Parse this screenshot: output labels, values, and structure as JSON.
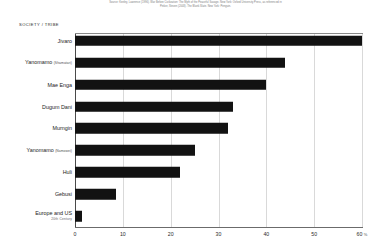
{
  "source_note": {
    "line1": "Source: Keeley, Lawrence (1996). War Before Civilization: The Myth of the Peaceful Savage. New York: Oxford University Press, as referenced in",
    "line2": "Pinker, Steven (2003). The Blank Slate. New York: Penguin."
  },
  "axis_title": "SOCIETY / TRIBE",
  "chart_data": {
    "type": "bar",
    "orientation": "horizontal",
    "title": "",
    "xlabel": "%",
    "ylabel": "SOCIETY / TRIBE",
    "xlim": [
      0,
      60
    ],
    "grid": true,
    "legend": "none",
    "xticks": [
      {
        "value": 0,
        "label": "0"
      },
      {
        "value": 10,
        "label": "10"
      },
      {
        "value": 20,
        "label": "20"
      },
      {
        "value": 30,
        "label": "30"
      },
      {
        "value": 40,
        "label": "40"
      },
      {
        "value": 50,
        "label": "50"
      },
      {
        "value": 60,
        "label": "60"
      }
    ],
    "x_unit": "%",
    "bar_color": "#121212",
    "categories": [
      "Jivaro",
      "Yanomamo (Shamatari)",
      "Mae Enga",
      "Dugum Dani",
      "Murngin",
      "Yanomamo (Namowei)",
      "Huli",
      "Gebusi",
      "Europe and US 20th Century"
    ],
    "values": [
      60,
      44,
      40,
      33,
      32,
      25,
      22,
      8.5,
      1.5
    ],
    "rows": [
      {
        "label": "Jivaro",
        "paren": "",
        "sub": "",
        "value": 60
      },
      {
        "label": "Yanomamo",
        "paren": "(Shamatari)",
        "sub": "",
        "value": 44
      },
      {
        "label": "Mae Enga",
        "paren": "",
        "sub": "",
        "value": 40
      },
      {
        "label": "Dugum Dani",
        "paren": "",
        "sub": "",
        "value": 33
      },
      {
        "label": "Murngin",
        "paren": "",
        "sub": "",
        "value": 32
      },
      {
        "label": "Yanomamo",
        "paren": "(Namowei)",
        "sub": "",
        "value": 25
      },
      {
        "label": "Huli",
        "paren": "",
        "sub": "",
        "value": 22
      },
      {
        "label": "Gebusi",
        "paren": "",
        "sub": "",
        "value": 8.5
      },
      {
        "label": "Europe and US",
        "paren": "",
        "sub": "20th Century",
        "value": 1.5
      }
    ]
  }
}
